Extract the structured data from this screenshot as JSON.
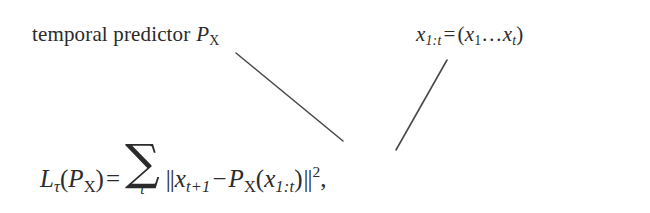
{
  "figure": {
    "background_color": "#ffffff",
    "ink_color": "#2b2b2b",
    "width": 650,
    "height": 213
  },
  "labels": {
    "left": {
      "text_plain": "temporal predictor P_X",
      "words": "temporal predictor",
      "symbol_base": "P",
      "symbol_sub": "X"
    },
    "right": {
      "text_plain": "x_{1:t} = (x_1 ... x_t)",
      "lhs_base": "x",
      "lhs_sub": "1:t",
      "relation": "=",
      "open_paren": "(",
      "term1_base": "x",
      "term1_sub": "1",
      "ellipsis": "…",
      "term2_base": "x",
      "term2_sub": "t",
      "close_paren": ")"
    }
  },
  "equation": {
    "text_plain": "L_τ(P_X) = Σ_t ||x_{t+1} − P_X(x_{1:t})||²,",
    "loss_base": "L",
    "loss_sub": "τ",
    "open_paren": "(",
    "predictor_base": "P",
    "predictor_sub": "X",
    "close_paren": ")",
    "relation": "=",
    "sum_glyph": "∑",
    "sum_limit": "t",
    "norm_open": "||",
    "target_base": "x",
    "target_sub": "t+1",
    "minus": "−",
    "pred_base": "P",
    "pred_sub": "X",
    "arg_open": "(",
    "arg_base": "x",
    "arg_sub": "1:t",
    "arg_close": ")",
    "norm_close": "||",
    "exponent": "2",
    "trailing_punctuation": ","
  },
  "leader_lines": [
    {
      "name": "leader-line-predictor",
      "from_label": "temporal predictor P_X",
      "to_term": "P_X in equation",
      "x1": 236,
      "y1": 53,
      "x2": 343,
      "y2": 141,
      "stroke_color": "#4a4a4a",
      "stroke_width": 1.6
    },
    {
      "name": "leader-line-sequence",
      "from_label": "x_{1:t} = (x_1 ... x_t)",
      "to_term": "x_{1:t} in equation",
      "x1": 447,
      "y1": 60,
      "x2": 396,
      "y2": 150,
      "stroke_color": "#4a4a4a",
      "stroke_width": 1.6
    }
  ]
}
